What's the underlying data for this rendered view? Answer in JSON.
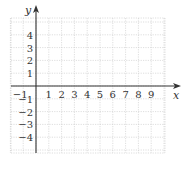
{
  "chart_data": {
    "type": "coordinate-grid",
    "title": "",
    "xlabel": "x",
    "ylabel": "y",
    "xlim": [
      -2,
      10
    ],
    "ylim": [
      -5,
      5
    ],
    "grid": true,
    "x_tick_labels": [
      "−1",
      "1",
      "2",
      "3",
      "4",
      "5",
      "6",
      "7",
      "8",
      "9"
    ],
    "x_tick_values": [
      -1,
      1,
      2,
      3,
      4,
      5,
      6,
      7,
      8,
      9
    ],
    "y_tick_labels": [
      "4",
      "3",
      "2",
      "1",
      "−1",
      "−2",
      "−3",
      "−4"
    ],
    "y_tick_values": [
      4,
      3,
      2,
      1,
      -1,
      -2,
      -3,
      -4
    ],
    "colors": {
      "axis": "#333333",
      "grid": "#c8c8c8"
    }
  }
}
